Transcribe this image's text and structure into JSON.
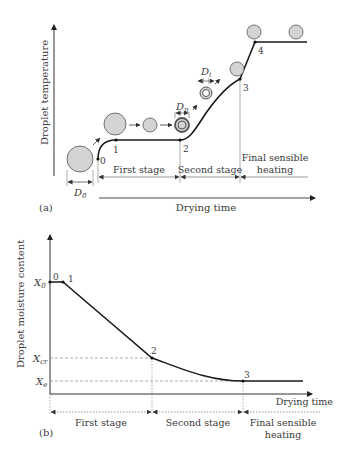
{
  "panel_a": {
    "label": "(a)",
    "y_axis_label": "Droplet temperature",
    "x_axis_label": "Drying time",
    "points": [
      "0",
      "1",
      "2",
      "3",
      "4"
    ],
    "stages": [
      "First stage",
      "Second stage",
      "Final sensible",
      "heating"
    ],
    "dimension_labels": {
      "d0": "D",
      "d0_sub": "0",
      "dp": "D",
      "dp_sub": "p",
      "di": "D",
      "di_sub": "i"
    },
    "colors": {
      "curve": "#1a1a1a",
      "droplet_fill": "#d4d4d4",
      "droplet_stroke": "#555555",
      "guide": "#9a9a9a"
    }
  },
  "panel_b": {
    "label": "(b)",
    "y_axis_label": "Droplet moisture content",
    "x_axis_label": "Drying time",
    "points": [
      "0",
      "1",
      "2",
      "3"
    ],
    "y_ticks": {
      "x0": "X",
      "x0_sub": "0",
      "xcr": "X",
      "xcr_sub": "cr",
      "xe": "X",
      "xe_sub": "e"
    },
    "stages": [
      "First stage",
      "Second stage",
      "Final sensible",
      "heating"
    ]
  }
}
